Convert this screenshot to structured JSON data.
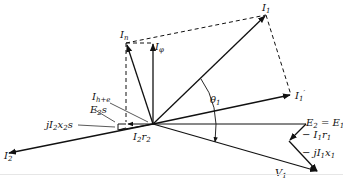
{
  "diagram": {
    "type": "phasor-diagram",
    "colors": {
      "stroke": "#111111",
      "background": "#ffffff"
    },
    "labels": {
      "I1": {
        "main": "I",
        "sub": "1"
      },
      "In": {
        "main": "I",
        "sub": "n"
      },
      "Iphi": {
        "main": "I",
        "sub": "φ"
      },
      "I1prime": {
        "main": "I",
        "sub": "1",
        "sup": "′"
      },
      "theta1": {
        "main": "θ",
        "sub": "1"
      },
      "Ihe": {
        "main": "I",
        "sub": "h+e"
      },
      "E2s": {
        "main": "E",
        "sub": "2",
        "tail": "s"
      },
      "jI2x2s": {
        "pre": "jI",
        "sub1": "2",
        "mid": "x",
        "sub2": "2",
        "tail": "s"
      },
      "I2r2": {
        "main": "I",
        "sub1": "2",
        "mid": "r",
        "sub2": "2"
      },
      "I2": {
        "main": "I",
        "sub": "2"
      },
      "E2eqE1": {
        "a": "E",
        "asub": "2",
        "eq": " = ",
        "b": "E",
        "bsub": "1"
      },
      "mI1r1": {
        "pre": "− I",
        "sub1": "1",
        "mid": "r",
        "sub2": "1"
      },
      "mjI1x1": {
        "pre": "− jI",
        "sub1": "1",
        "mid": "x",
        "sub2": "1"
      },
      "V1": {
        "main": "V",
        "sub": "1"
      }
    },
    "vectors": [
      {
        "name": "I1",
        "from": [
          153,
          124
        ],
        "to": [
          266,
          15
        ],
        "style": "solid-arrow"
      },
      {
        "name": "In",
        "from": [
          153,
          124
        ],
        "to": [
          126,
          43
        ],
        "style": "solid-arrow"
      },
      {
        "name": "Iphi",
        "from": [
          153,
          124
        ],
        "to": [
          153,
          43
        ],
        "style": "solid-arrow"
      },
      {
        "name": "I1prime",
        "from": [
          153,
          124
        ],
        "to": [
          291,
          95
        ],
        "style": "solid-arrow"
      },
      {
        "name": "E2=E1",
        "from": [
          153,
          124
        ],
        "to": [
          306,
          124
        ],
        "style": "solid-line"
      },
      {
        "name": "I2",
        "from": [
          153,
          124
        ],
        "to": [
          8,
          153
        ],
        "style": "solid-arrow"
      },
      {
        "name": "V1",
        "from": [
          153,
          124
        ],
        "to": [
          318,
          172
        ],
        "style": "solid-arrow"
      },
      {
        "name": "-I1r1",
        "from": [
          306,
          124
        ],
        "to": [
          289,
          141
        ],
        "style": "solid-arrow"
      },
      {
        "name": "-jI1x1",
        "from": [
          289,
          141
        ],
        "to": [
          318,
          172
        ],
        "style": "solid-arrow"
      },
      {
        "name": "Ih+e",
        "from": [
          153,
          124
        ],
        "to": [
          126,
          124
        ],
        "style": "solid-arrow"
      }
    ]
  }
}
